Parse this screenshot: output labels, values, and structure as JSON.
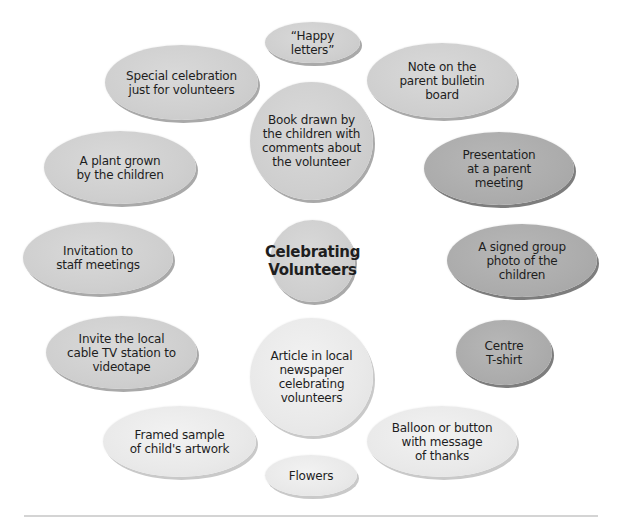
{
  "diagram": {
    "title": "Celebrating Volunteers",
    "center": {
      "label": "Celebrating\nVolunteers",
      "tone": "mid"
    },
    "ideas": [
      {
        "id": "happy-letters",
        "label": "“Happy letters”",
        "tone": "mid"
      },
      {
        "id": "special-celebration",
        "label": "Special celebration\njust for volunteers",
        "tone": "mid"
      },
      {
        "id": "note-bulletin",
        "label": "Note on the\nparent bulletin\nboard",
        "tone": "mid"
      },
      {
        "id": "book-drawn",
        "label": "Book drawn by\nthe children with\ncomments about\nthe volunteer",
        "tone": "mid"
      },
      {
        "id": "plant-grown",
        "label": "A plant grown\nby the children",
        "tone": "mid"
      },
      {
        "id": "presentation",
        "label": "Presentation\nat a parent\nmeeting",
        "tone": "dark"
      },
      {
        "id": "invitation-staff",
        "label": "Invitation to\nstaff meetings",
        "tone": "mid"
      },
      {
        "id": "signed-photo",
        "label": "A signed group\nphoto of the\nchildren",
        "tone": "dark"
      },
      {
        "id": "cable-tv",
        "label": "Invite the local\ncable TV station to\nvideotape",
        "tone": "mid"
      },
      {
        "id": "newspaper-article",
        "label": "Article in local\nnewspaper\ncelebrating\nvolunteers",
        "tone": "light"
      },
      {
        "id": "centre-tshirt",
        "label": "Centre\nT-shirt",
        "tone": "dark"
      },
      {
        "id": "framed-artwork",
        "label": "Framed sample\nof child's artwork",
        "tone": "light"
      },
      {
        "id": "balloon-button",
        "label": "Balloon or button\nwith message\nof thanks",
        "tone": "light"
      },
      {
        "id": "flowers",
        "label": "Flowers",
        "tone": "light"
      }
    ],
    "colors": {
      "light": "#e9e9e9",
      "mid": "#cfcfcf",
      "dark": "#acacac",
      "text": "#1e1e1e",
      "rule": "#d4d4d4"
    }
  }
}
